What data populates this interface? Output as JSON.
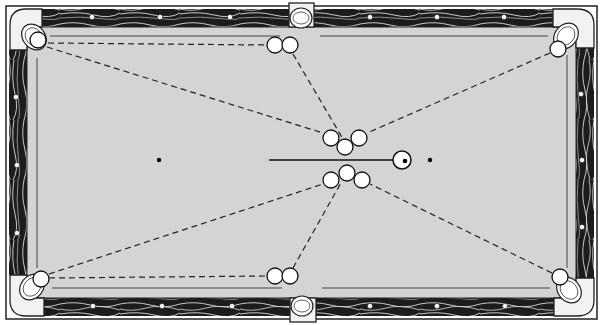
{
  "diagram": {
    "colors": {
      "felt": "#d4d4d4",
      "felt_border": "#c4c4c4",
      "rail_wood": "#1c1c1c",
      "rail_grain": "#d9d9d9",
      "outline": "#222222",
      "ball": "#ffffff",
      "pocket_cap": "#f2f2f2",
      "dash": "#222222"
    },
    "table": {
      "x": 6,
      "y": 6,
      "w": 591,
      "h": 313
    },
    "pockets": [
      {
        "id": "top-left",
        "cx": 34,
        "cy": 37
      },
      {
        "id": "top-middle",
        "cx": 301,
        "cy": 18
      },
      {
        "id": "top-right",
        "cx": 566,
        "cy": 36
      },
      {
        "id": "bottom-left",
        "cx": 32,
        "cy": 287
      },
      {
        "id": "bottom-middle",
        "cx": 302,
        "cy": 306
      },
      {
        "id": "bottom-right",
        "cx": 569,
        "cy": 290
      }
    ],
    "diamonds": {
      "top": [
        [
          92,
          17
        ],
        [
          160,
          17
        ],
        [
          230,
          17
        ],
        [
          370,
          17
        ],
        [
          437,
          17
        ],
        [
          504,
          17
        ]
      ],
      "bottom": [
        [
          93,
          306
        ],
        [
          162,
          306
        ],
        [
          232,
          306
        ],
        [
          370,
          306
        ],
        [
          437,
          306
        ],
        [
          505,
          306
        ]
      ],
      "left": [
        [
          16,
          97
        ],
        [
          17,
          165
        ],
        [
          17,
          233
        ]
      ],
      "right": [
        [
          581,
          94
        ],
        [
          582,
          160
        ],
        [
          582,
          227
        ]
      ]
    },
    "spots": [
      {
        "id": "head-spot",
        "cx": 159,
        "cy": 160
      },
      {
        "id": "foot-spot",
        "cx": 430,
        "cy": 160
      }
    ],
    "cue_ball": {
      "cx": 402,
      "cy": 160,
      "r": 9
    },
    "cue_stick": {
      "x1": 269,
      "y1": 160,
      "x2": 393,
      "y2": 160
    },
    "object_balls": [
      {
        "id": "cluster-top-1",
        "cx": 331,
        "cy": 138
      },
      {
        "id": "cluster-top-2",
        "cx": 345,
        "cy": 147
      },
      {
        "id": "cluster-top-3",
        "cx": 359,
        "cy": 138
      },
      {
        "id": "cluster-bottom-1",
        "cx": 331,
        "cy": 180
      },
      {
        "id": "cluster-bottom-2",
        "cx": 347,
        "cy": 173
      },
      {
        "id": "cluster-bottom-3",
        "cx": 362,
        "cy": 180
      },
      {
        "id": "top-left-pocket-ball",
        "cx": 38,
        "cy": 40
      },
      {
        "id": "top-right-pocket-ball",
        "cx": 558,
        "cy": 49
      },
      {
        "id": "bottom-left-pocket-ball",
        "cx": 41,
        "cy": 279
      },
      {
        "id": "bottom-right-pocket-ball",
        "cx": 560,
        "cy": 277
      },
      {
        "id": "top-mid-ball-1",
        "cx": 275,
        "cy": 45
      },
      {
        "id": "top-mid-ball-2",
        "cx": 290,
        "cy": 45
      },
      {
        "id": "bottom-mid-ball-1",
        "cx": 275,
        "cy": 276
      },
      {
        "id": "bottom-mid-ball-2",
        "cx": 290,
        "cy": 276
      }
    ],
    "ball_radius": 8,
    "paths": [
      {
        "id": "tl-straight",
        "x1": 48,
        "y1": 43,
        "x2": 267,
        "y2": 45
      },
      {
        "id": "tl-diagonal",
        "x1": 47,
        "y1": 47,
        "x2": 323,
        "y2": 133
      },
      {
        "id": "top-mid-to-cluster",
        "x1": 293,
        "y1": 54,
        "x2": 343,
        "y2": 139
      },
      {
        "id": "tr-diagonal",
        "x1": 550,
        "y1": 53,
        "x2": 367,
        "y2": 133
      },
      {
        "id": "bl-diagonal",
        "x1": 49,
        "y1": 274,
        "x2": 323,
        "y2": 184
      },
      {
        "id": "bl-straight",
        "x1": 49,
        "y1": 278,
        "x2": 267,
        "y2": 276
      },
      {
        "id": "bottom-mid-to-cluster",
        "x1": 293,
        "y1": 268,
        "x2": 342,
        "y2": 181
      },
      {
        "id": "br-diagonal",
        "x1": 552,
        "y1": 273,
        "x2": 370,
        "y2": 184
      }
    ]
  }
}
